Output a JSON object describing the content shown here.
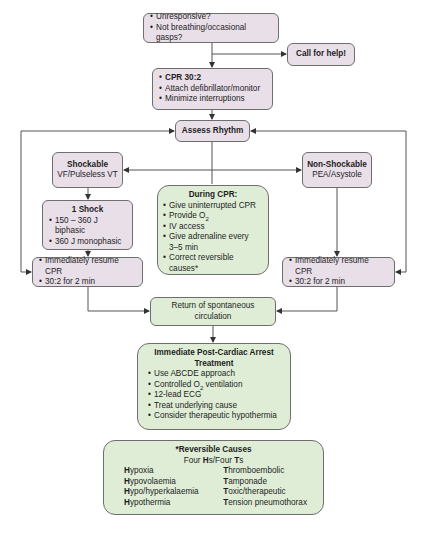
{
  "colors": {
    "pink_fill": "#e9dfe8",
    "green_fill": "#dfedd6",
    "border": "#6e6e6e",
    "line": "#555555"
  },
  "initial": {
    "items": [
      "Unresponsive?",
      "Not breathing/occasional gasps?"
    ]
  },
  "call_help": {
    "label": "Call for help!"
  },
  "cpr": {
    "items": [
      "CPR 30:2",
      "Attach defibrillator/monitor",
      "Minimize interruptions"
    ]
  },
  "assess": {
    "label": "Assess Rhythm"
  },
  "shockable": {
    "title": "Shockable",
    "subtitle": "VF/Pulseless VT"
  },
  "non_shockable": {
    "title": "Non-Shockable",
    "subtitle": "PEA/Asystole"
  },
  "shock": {
    "title": "1 Shock",
    "items": [
      "150 – 360 J biphasic",
      "360 J monophasic"
    ]
  },
  "resume_left": {
    "items": [
      "Immediately resume CPR",
      "30:2 for 2 min"
    ]
  },
  "resume_right": {
    "items": [
      "Immediately resume CPR",
      "30:2 for 2 min"
    ]
  },
  "during_cpr": {
    "title": "During CPR:",
    "items": [
      "Give uninterrupted  CPR",
      "Provide O",
      "IV access",
      "Give adrenaline every",
      "3–5 min",
      "Correct reversible causes*"
    ],
    "o2_sub": "2"
  },
  "rosc": {
    "label": "Return of spontaneous circulation"
  },
  "post_arrest": {
    "title": "Immediate Post-Cardiac Arrest Treatment",
    "items": [
      "Use ABCDE approach",
      "Controlled O",
      "12-lead ECG",
      "Treat underlying cause",
      "Consider therapeutic hypothermia"
    ],
    "o2_sub": "2",
    "o2_suffix": " ventilation"
  },
  "reversible": {
    "title": "*Reversible Causes",
    "subtitle_parts": [
      "Four ",
      "H",
      "s/Four ",
      "T",
      "s"
    ],
    "hs": [
      {
        "initial": "H",
        "rest": "ypoxia"
      },
      {
        "initial": "H",
        "rest": "ypovolaemia"
      },
      {
        "initial": "H",
        "rest": "ypo/hyperkalaemia"
      },
      {
        "initial": "H",
        "rest": "ypothermia"
      }
    ],
    "ts": [
      {
        "initial": "T",
        "rest": "hromboembolic"
      },
      {
        "initial": "T",
        "rest": "amponade"
      },
      {
        "initial": "T",
        "rest": "oxic/therapeutic"
      },
      {
        "initial": "T",
        "rest": "ension pneumothorax"
      }
    ]
  }
}
